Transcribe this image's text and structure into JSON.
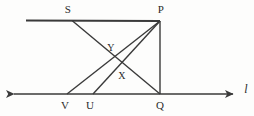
{
  "figure": {
    "kind": "geometry-diagram",
    "stroke_color": "#3a3a3a",
    "background_color": "#fdfdfc",
    "width": 254,
    "height": 116,
    "points": [
      {
        "id": "S",
        "label": "S",
        "x": 72,
        "y": 20,
        "label_x": 68,
        "label_y": 9
      },
      {
        "id": "P",
        "label": "P",
        "x": 160,
        "y": 21,
        "label_x": 161,
        "label_y": 9
      },
      {
        "id": "Y",
        "label": "Y",
        "x": 112,
        "y": 55,
        "label_x": 111,
        "label_y": 47
      },
      {
        "id": "X",
        "label": "X",
        "x": 120,
        "y": 68,
        "label_x": 122,
        "label_y": 75
      },
      {
        "id": "V",
        "label": "V",
        "x": 67,
        "y": 94,
        "label_x": 65,
        "label_y": 105
      },
      {
        "id": "U",
        "label": "U",
        "x": 93,
        "y": 94,
        "label_x": 90,
        "label_y": 105
      },
      {
        "id": "Q",
        "label": "Q",
        "x": 160,
        "y": 94,
        "label_x": 160,
        "label_y": 105
      }
    ],
    "line_label": {
      "text": "l",
      "x": 246,
      "y": 89
    },
    "segments": [
      {
        "name": "top-horizontal-line",
        "from": [
          26,
          20
        ],
        "to": [
          160,
          21
        ]
      },
      {
        "name": "segment-S-to-Q",
        "from": [
          72,
          20
        ],
        "to": [
          160,
          94
        ]
      },
      {
        "name": "segment-P-to-V",
        "from": [
          160,
          21
        ],
        "to": [
          67,
          94
        ]
      },
      {
        "name": "segment-P-to-U",
        "from": [
          160,
          21
        ],
        "to": [
          93,
          94
        ]
      },
      {
        "name": "segment-P-to-Q",
        "from": [
          160,
          21
        ],
        "to": [
          160,
          94
        ]
      }
    ],
    "axis": {
      "name": "line-l",
      "from": [
        10,
        94
      ],
      "to": [
        237,
        94
      ],
      "arrows": "both"
    }
  }
}
